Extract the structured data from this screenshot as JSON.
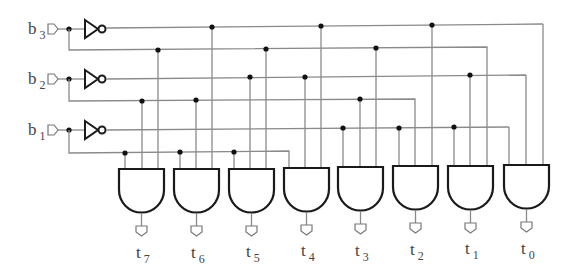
{
  "diagram": {
    "type": "3-to-8 decoder logic circuit",
    "inputs": [
      {
        "name": "b",
        "sub": "3",
        "y_true": 50,
        "y_comp": 28,
        "label_y": 22
      },
      {
        "name": "b",
        "sub": "2",
        "y_true": 101,
        "y_comp": 78,
        "label_y": 73
      },
      {
        "name": "b",
        "sub": "1",
        "y_true": 153,
        "y_comp": 129,
        "label_y": 125
      }
    ],
    "outputs": [
      {
        "name": "t",
        "sub": "7",
        "gate_x": 119,
        "taps": [
          "b1",
          "b2",
          "b3"
        ]
      },
      {
        "name": "t",
        "sub": "6",
        "gate_x": 174,
        "taps": [
          "b1",
          "b2",
          "b3'"
        ]
      },
      {
        "name": "t",
        "sub": "5",
        "gate_x": 229,
        "taps": [
          "b1",
          "b2'",
          "b3"
        ]
      },
      {
        "name": "t",
        "sub": "4",
        "gate_x": 284,
        "taps": [
          "b1",
          "b2'",
          "b3'"
        ]
      },
      {
        "name": "t",
        "sub": "3",
        "gate_x": 338,
        "taps": [
          "b1'",
          "b2",
          "b3"
        ]
      },
      {
        "name": "t",
        "sub": "2",
        "gate_x": 393,
        "taps": [
          "b1'",
          "b2",
          "b3'"
        ]
      },
      {
        "name": "t",
        "sub": "1",
        "gate_x": 448,
        "taps": [
          "b1'",
          "b2'",
          "b3"
        ]
      },
      {
        "name": "t",
        "sub": "0",
        "gate_x": 503,
        "taps": [
          "b1'",
          "b2'",
          "b3'"
        ]
      }
    ],
    "colors": {
      "wire": "#8a8a8a",
      "gate": "#1a1a1a",
      "dot": "#111111",
      "text": "#444444"
    }
  }
}
